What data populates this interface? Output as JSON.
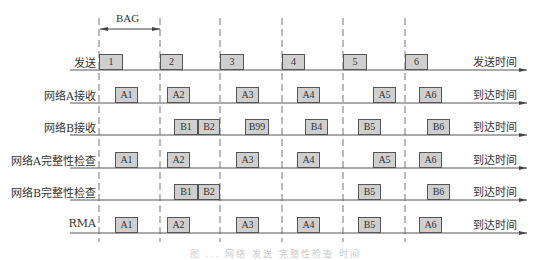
{
  "diagram": {
    "bag_label": "BAG",
    "caption": "图 ...  网络 发送 完整性检查 时间",
    "dashed_lines_x": [
      99,
      160,
      220,
      282,
      343,
      405
    ],
    "box_fill": "#cfcfcf",
    "box_border": "#555555",
    "line_color": "#555555",
    "rows": [
      {
        "label": "发送",
        "axis_label": "发送时间",
        "y": 70,
        "boxes": [
          {
            "text": "1",
            "x": 99,
            "w": 24
          },
          {
            "text": "2",
            "x": 160,
            "w": 23
          },
          {
            "text": "3",
            "x": 220,
            "w": 24
          },
          {
            "text": "4",
            "x": 282,
            "w": 23
          },
          {
            "text": "5",
            "x": 343,
            "w": 24
          },
          {
            "text": "6",
            "x": 405,
            "w": 23
          }
        ]
      },
      {
        "label": "网络A接收",
        "axis_label": "到达时间",
        "y": 103,
        "boxes": [
          {
            "text": "A1",
            "x": 115,
            "w": 23
          },
          {
            "text": "A2",
            "x": 167,
            "w": 23
          },
          {
            "text": "A3",
            "x": 236,
            "w": 23
          },
          {
            "text": "A4",
            "x": 297,
            "w": 23
          },
          {
            "text": "A5",
            "x": 373,
            "w": 23
          },
          {
            "text": "A6",
            "x": 419,
            "w": 23
          }
        ]
      },
      {
        "label": "网络B接收",
        "axis_label": "到达时间",
        "y": 135,
        "boxes": [
          {
            "text": "B1",
            "x": 174,
            "w": 24
          },
          {
            "text": "B2",
            "x": 198,
            "w": 22
          },
          {
            "text": "B99",
            "x": 245,
            "w": 24
          },
          {
            "text": "B4",
            "x": 305,
            "w": 23
          },
          {
            "text": "B5",
            "x": 358,
            "w": 23
          },
          {
            "text": "B6",
            "x": 427,
            "w": 23
          }
        ]
      },
      {
        "label": "网络A完整性检查",
        "axis_label": "到达时间",
        "y": 168,
        "boxes": [
          {
            "text": "A1",
            "x": 115,
            "w": 23
          },
          {
            "text": "A2",
            "x": 167,
            "w": 23
          },
          {
            "text": "A3",
            "x": 236,
            "w": 23
          },
          {
            "text": "A4",
            "x": 297,
            "w": 23
          },
          {
            "text": "A5",
            "x": 373,
            "w": 23
          },
          {
            "text": "A6",
            "x": 419,
            "w": 23
          }
        ]
      },
      {
        "label": "网络B完整性检查",
        "axis_label": "到达时间",
        "y": 200,
        "boxes": [
          {
            "text": "B1",
            "x": 174,
            "w": 24
          },
          {
            "text": "B2",
            "x": 198,
            "w": 22
          },
          {
            "text": "B5",
            "x": 358,
            "w": 23
          },
          {
            "text": "B6",
            "x": 427,
            "w": 23
          }
        ]
      },
      {
        "label": "RMA",
        "axis_label": "到达时间",
        "y": 233,
        "boxes": [
          {
            "text": "A1",
            "x": 115,
            "w": 23
          },
          {
            "text": "A2",
            "x": 167,
            "w": 23
          },
          {
            "text": "A3",
            "x": 236,
            "w": 23
          },
          {
            "text": "A4",
            "x": 297,
            "w": 23
          },
          {
            "text": "B5",
            "x": 358,
            "w": 23
          },
          {
            "text": "A6",
            "x": 419,
            "w": 23
          }
        ]
      }
    ]
  }
}
